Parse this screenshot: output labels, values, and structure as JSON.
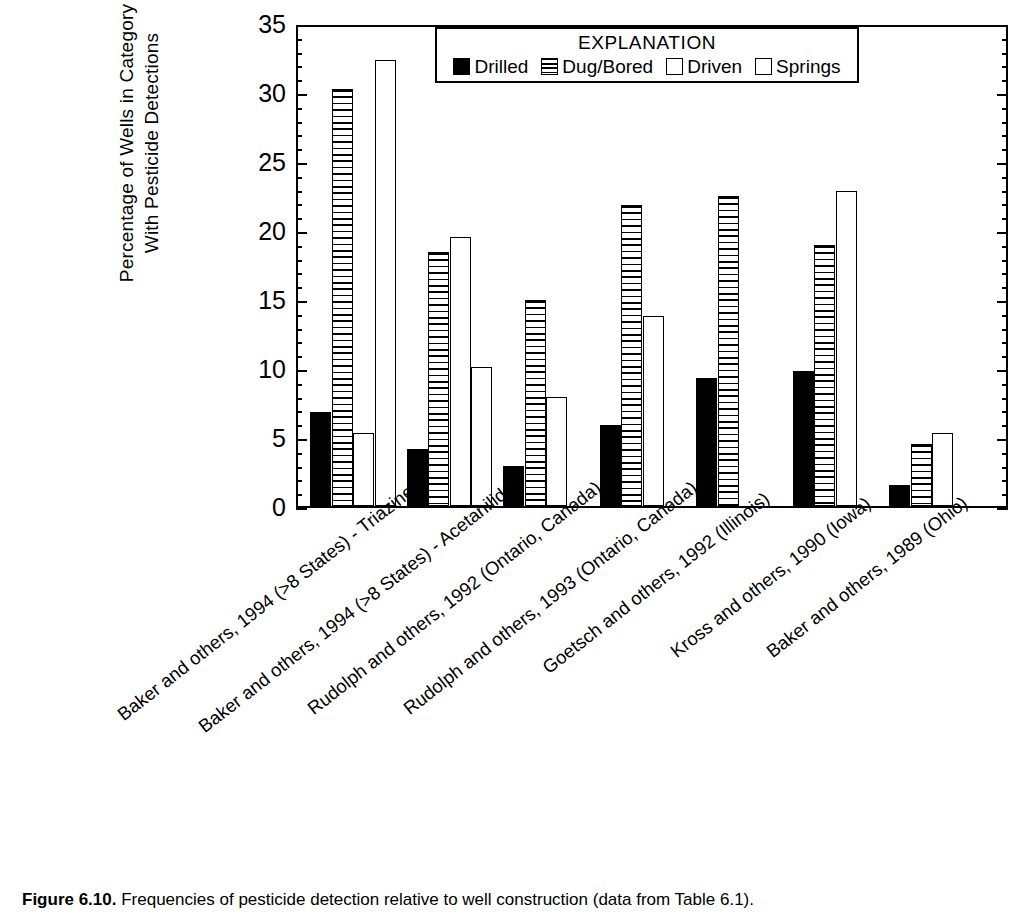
{
  "figure": {
    "caption_label": "Figure 6.10.",
    "caption_text": " Frequencies of pesticide detection relative to well construction (data from Table 6.1)."
  },
  "legend": {
    "title": "EXPLANATION",
    "entries": [
      {
        "label": "Drilled",
        "swatch": "solid-black-square",
        "color": "#000000"
      },
      {
        "label": "Dug/Bored",
        "swatch": "horizontal-striped-square",
        "color": "#000000"
      },
      {
        "label": "Driven",
        "swatch": "empty-white-square",
        "color": "#ffffff"
      },
      {
        "label": "Springs",
        "swatch": "empty-white-square",
        "color": "#ffffff"
      }
    ]
  },
  "axes": {
    "y_title_line1": "Percentage of Wells in Category",
    "y_title_line2": "With Pesticide Detections",
    "y_ticks": [
      "0",
      "5",
      "10",
      "15",
      "20",
      "25",
      "30",
      "35"
    ]
  },
  "chart_data": {
    "type": "bar",
    "title": "",
    "xlabel": "",
    "ylabel": "Percentage of Wells in Category With Pesticide Detections",
    "ylim": [
      0,
      35
    ],
    "ytick_values": [
      0,
      5,
      10,
      15,
      20,
      25,
      30,
      35
    ],
    "yminor_step": 1,
    "grid": false,
    "legend_position": "inside-top-right",
    "categories": [
      "Baker and others, 1994 (>8 States) - Triazines",
      "Baker and others, 1994 (>8 States) - Acetanilides",
      "Rudolph and others, 1992 (Ontario, Canada)",
      "Rudolph and others, 1993 (Ontario, Canada)",
      "Goetsch and others, 1992 (Illinois)",
      "Kross and others, 1990 (Iowa)",
      "Baker and others, 1989 (Ohio)"
    ],
    "series": [
      {
        "name": "Drilled",
        "values": [
          6.8,
          4.1,
          2.9,
          5.9,
          9.3,
          9.8,
          1.5
        ]
      },
      {
        "name": "Dug/Bored",
        "values": [
          30.2,
          18.4,
          14.9,
          21.8,
          22.5,
          18.9,
          4.5
        ]
      },
      {
        "name": "Driven",
        "values": [
          5.3,
          19.5,
          null,
          null,
          null,
          null,
          null
        ]
      },
      {
        "name": "Springs",
        "values": [
          32.3,
          10.1,
          7.9,
          13.8,
          null,
          22.8,
          5.3
        ]
      }
    ]
  }
}
